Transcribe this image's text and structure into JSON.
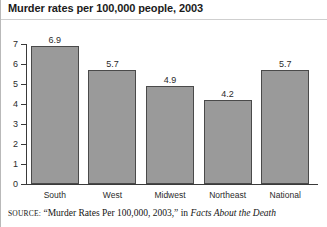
{
  "title": "Murder rates per 100,000 people, 2003",
  "source": {
    "label": "SOURCE:",
    "citation": "“Murder Rates Per 100,000, 2003,” in",
    "publication": "Facts About the Death"
  },
  "colors": {
    "bar_fill": "#9a9a9a",
    "bar_border": "#4a4a4a",
    "axis": "#3a3a3a",
    "text": "#2b2b2b",
    "title_text": "#1b1b1b",
    "background": "#ffffff"
  },
  "chart_data": {
    "type": "bar",
    "title": "Murder rates per 100,000 people, 2003",
    "xlabel": "",
    "ylabel": "",
    "categories": [
      "South",
      "West",
      "Midwest",
      "Northeast",
      "National"
    ],
    "values": [
      6.9,
      5.7,
      4.9,
      4.2,
      5.7
    ],
    "value_labels": [
      "6.9",
      "5.7",
      "4.9",
      "4.2",
      "5.7"
    ],
    "ylim": [
      0,
      7
    ],
    "yticks": [
      0,
      1,
      2,
      3,
      4,
      5,
      6,
      7
    ],
    "ytick_labels": [
      "0",
      "1",
      "2",
      "3",
      "4",
      "5",
      "6",
      "7"
    ],
    "grid": false,
    "legend": false,
    "series": [
      {
        "name": "Murder rate per 100,000",
        "values": [
          6.9,
          5.7,
          4.9,
          4.2,
          5.7
        ]
      }
    ]
  }
}
